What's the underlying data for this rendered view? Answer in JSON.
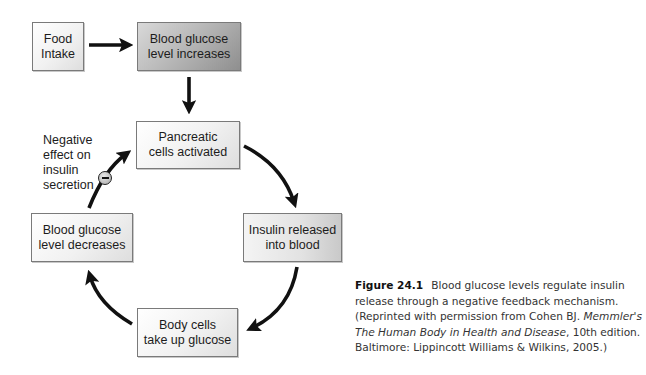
{
  "diagram": {
    "boxes": {
      "food_intake": "Food\nIntake",
      "glucose_increases": "Blood glucose\nlevel increases",
      "pancreatic": "Pancreatic\ncells activated",
      "insulin_released": "Insulin released\ninto blood",
      "cells_uptake": "Body cells\ntake up glucose",
      "glucose_decreases": "Blood glucose\nlevel decreases"
    },
    "negative_label": "Negative\neffect on\ninsulin\nsecretion",
    "negative_symbol": "minus"
  },
  "caption": {
    "figure_label": "Figure 24.1",
    "text_1": "Blood glucose levels regulate insulin release through a negative feedback mechanism. (Reprinted with permission from Cohen BJ. ",
    "italic_title": "Memmler's The Human Body in Health and Disease",
    "text_2": ", 10th edition. Baltimore: Lippincott Williams & Wilkins, 2005.)"
  },
  "colors": {
    "arrow": "#111111",
    "box_border": "#7a7a7a",
    "dark_box_fill": "#a8a8a8",
    "light_box_fill": "#eeeeee"
  }
}
